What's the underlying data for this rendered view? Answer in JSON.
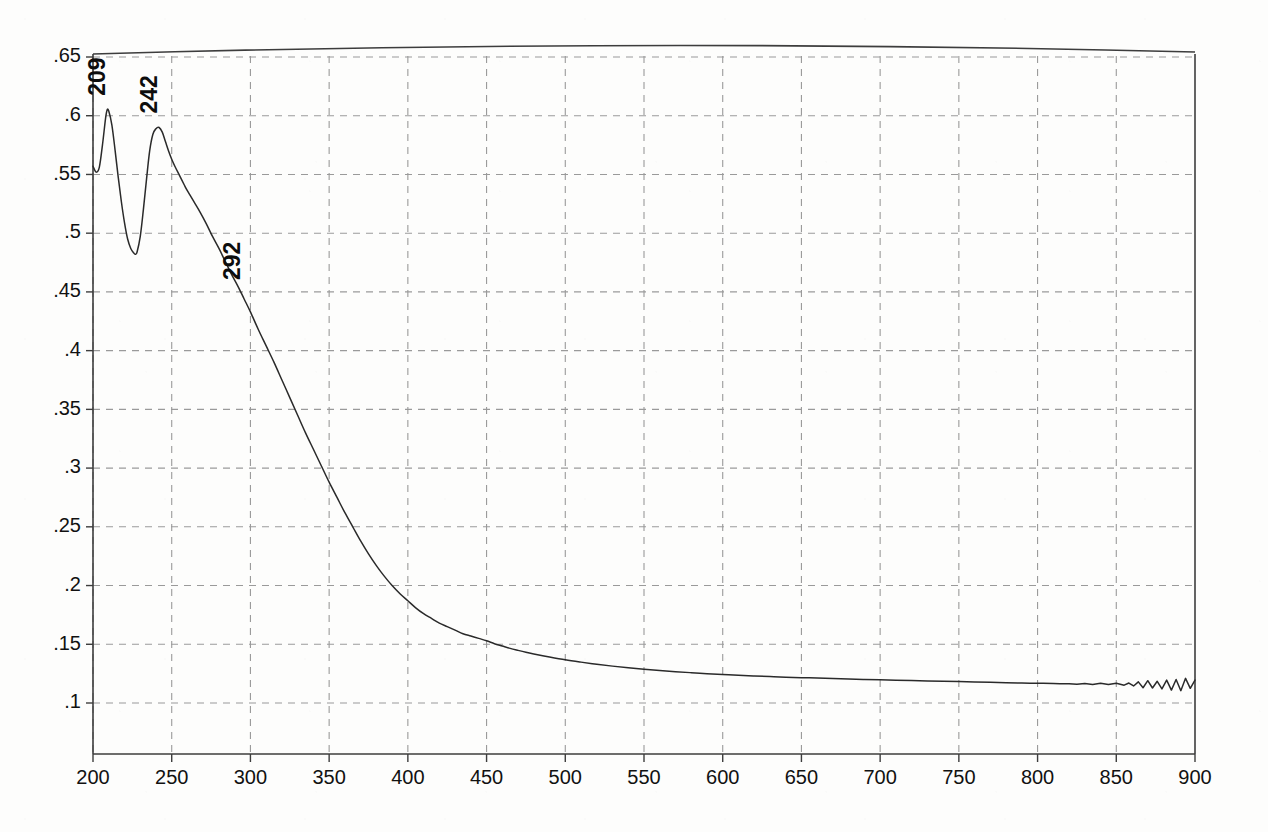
{
  "chart_data": {
    "type": "line",
    "title": "",
    "subtitle": "",
    "xlabel": "",
    "ylabel": "",
    "xlim": [
      200,
      900
    ],
    "ylim": [
      0.075,
      0.66
    ],
    "grid": true,
    "legend": "none",
    "x_ticks": [
      200,
      250,
      300,
      350,
      400,
      450,
      500,
      550,
      600,
      650,
      700,
      750,
      800,
      850,
      900
    ],
    "x_tick_labels": [
      "200",
      "250",
      "300",
      "350",
      "400",
      "450",
      "500",
      "550",
      "600",
      "650",
      "700",
      "750",
      "800",
      "850",
      "900"
    ],
    "y_ticks": [
      0.1,
      0.15,
      0.2,
      0.25,
      0.3,
      0.35,
      0.4,
      0.45,
      0.5,
      0.55,
      0.6,
      0.65
    ],
    "y_tick_labels": [
      ".1",
      ".15",
      ".2",
      ".25",
      ".3",
      ".35",
      ".4",
      ".45",
      ".5",
      ".55",
      ".6",
      ".65"
    ],
    "series": [
      {
        "name": "absorbance",
        "color": "#2a2a2a",
        "x": [
          200,
          202,
          204,
          206,
          208,
          209,
          210,
          212,
          214,
          216,
          218,
          220,
          222,
          224,
          226,
          227,
          228,
          230,
          232,
          234,
          236,
          238,
          240,
          242,
          244,
          246,
          248,
          250,
          252,
          255,
          258,
          260,
          264,
          268,
          272,
          276,
          280,
          284,
          288,
          292,
          296,
          300,
          305,
          310,
          315,
          320,
          325,
          330,
          335,
          340,
          345,
          350,
          355,
          360,
          365,
          370,
          375,
          380,
          385,
          390,
          395,
          400,
          405,
          410,
          415,
          420,
          425,
          430,
          435,
          440,
          445,
          450,
          455,
          460,
          465,
          470,
          475,
          480,
          490,
          500,
          510,
          520,
          530,
          540,
          550,
          560,
          570,
          580,
          590,
          600,
          610,
          620,
          630,
          640,
          650,
          660,
          670,
          680,
          690,
          700,
          710,
          720,
          730,
          740,
          750,
          760,
          770,
          780,
          790,
          800,
          810,
          815,
          820,
          825,
          830,
          835,
          840,
          845,
          850,
          855,
          858,
          861,
          864,
          867,
          870,
          873,
          876,
          879,
          882,
          885,
          888,
          891,
          894,
          897,
          900
        ],
        "y": [
          0.557,
          0.552,
          0.556,
          0.575,
          0.598,
          0.605,
          0.604,
          0.592,
          0.571,
          0.548,
          0.527,
          0.509,
          0.495,
          0.487,
          0.483,
          0.482,
          0.484,
          0.497,
          0.52,
          0.546,
          0.57,
          0.584,
          0.589,
          0.59,
          0.586,
          0.578,
          0.57,
          0.563,
          0.557,
          0.549,
          0.541,
          0.536,
          0.527,
          0.518,
          0.508,
          0.497,
          0.487,
          0.476,
          0.465,
          0.455,
          0.444,
          0.433,
          0.418,
          0.404,
          0.39,
          0.375,
          0.36,
          0.345,
          0.33,
          0.316,
          0.302,
          0.288,
          0.275,
          0.262,
          0.25,
          0.238,
          0.227,
          0.217,
          0.208,
          0.2,
          0.193,
          0.187,
          0.181,
          0.176,
          0.172,
          0.168,
          0.165,
          0.162,
          0.159,
          0.157,
          0.155,
          0.153,
          0.1505,
          0.1485,
          0.1465,
          0.1448,
          0.1432,
          0.1418,
          0.1392,
          0.1368,
          0.1348,
          0.133,
          0.1314,
          0.13,
          0.1288,
          0.1277,
          0.1267,
          0.1258,
          0.125,
          0.1243,
          0.1236,
          0.123,
          0.1225,
          0.122,
          0.1216,
          0.1212,
          0.1208,
          0.1204,
          0.12,
          0.1197,
          0.1194,
          0.1191,
          0.1188,
          0.1185,
          0.1182,
          0.1179,
          0.1176,
          0.1173,
          0.117,
          0.1168,
          0.1166,
          0.1164,
          0.1163,
          0.116,
          0.1166,
          0.1158,
          0.1169,
          0.1157,
          0.1168,
          0.1152,
          0.117,
          0.1145,
          0.118,
          0.113,
          0.119,
          0.1128,
          0.1185,
          0.112,
          0.1195,
          0.111,
          0.12,
          0.1105,
          0.121,
          0.1125,
          0.1195
        ]
      }
    ],
    "annotations": [
      {
        "label": "209",
        "x": 209,
        "y": 0.605,
        "rotation": -90,
        "name": "peak-label-209"
      },
      {
        "label": "242",
        "x": 242,
        "y": 0.59,
        "rotation": -90,
        "name": "peak-label-242"
      },
      {
        "label": "292",
        "x": 292,
        "y": 0.455,
        "rotation": -90,
        "name": "peak-label-292"
      }
    ],
    "baseline_trace": {
      "name": "upper-frame-trace",
      "description": "faint bowed trace along top border of plot frame"
    }
  },
  "colors": {
    "curve": "#2a2a2a",
    "grid": "#9a9a9a",
    "frame": "#3d3d3d",
    "text": "#111111",
    "background": "#fdfdfc"
  }
}
